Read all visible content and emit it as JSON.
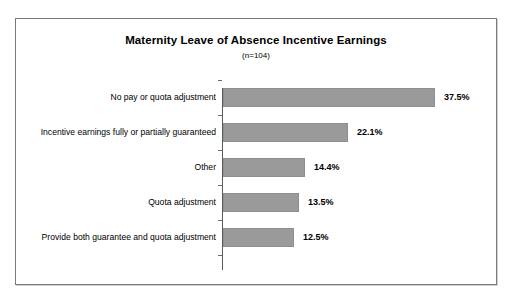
{
  "chart_data": {
    "type": "bar",
    "orientation": "horizontal",
    "title": "Maternity Leave of Absence Incentive Earnings",
    "subtitle": "(n=104)",
    "xlabel": "",
    "ylabel": "",
    "xlim": [
      0,
      40
    ],
    "grid": false,
    "legend": "none",
    "bar_color": "#9a9a9a",
    "categories": [
      "No pay or quota adjustment",
      "Incentive earnings fully or partially guaranteed",
      "Other",
      "Quota adjustment",
      "Provide both guarantee and quota adjustment"
    ],
    "values": [
      37.5,
      22.1,
      14.4,
      13.5,
      12.5
    ],
    "value_labels": [
      "37.5%",
      "22.1%",
      "14.4%",
      "13.5%",
      "12.5%"
    ]
  }
}
